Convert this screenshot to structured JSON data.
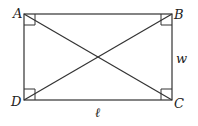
{
  "diagram": {
    "vertices": [
      {
        "name": "A",
        "x": 24,
        "y": 14
      },
      {
        "name": "B",
        "x": 172,
        "y": 14
      },
      {
        "name": "C",
        "x": 172,
        "y": 100
      },
      {
        "name": "D",
        "x": 24,
        "y": 100
      }
    ],
    "labels": {
      "A": "A",
      "B": "B",
      "C": "C",
      "D": "D",
      "width": "w",
      "length": "ℓ"
    },
    "right_angle_markers": [
      "A",
      "B",
      "C",
      "D"
    ],
    "diagonals": [
      "AC",
      "BD"
    ]
  }
}
